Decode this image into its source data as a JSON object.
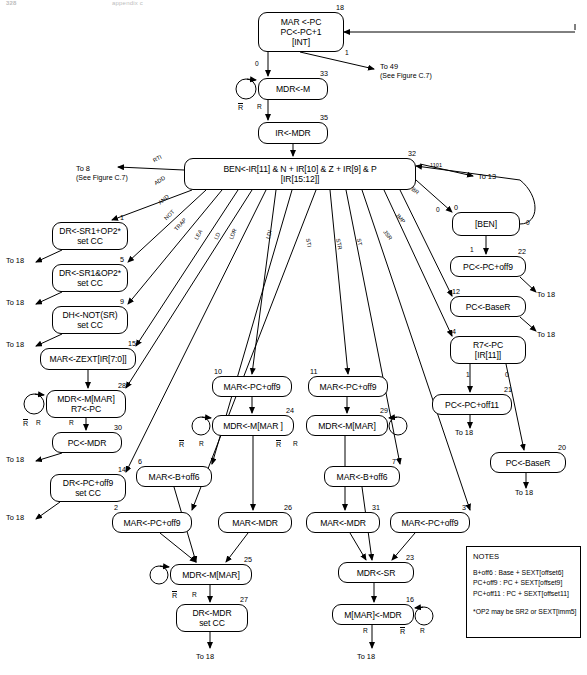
{
  "page": {
    "header_left": "328",
    "header_right": "appendix c"
  },
  "notes": {
    "title": "NOTES",
    "lines": [
      "B+off6 : Base + SEXT[offset6]",
      "PC+off9 : PC + SEXT[offset9]",
      "PC+off11 : PC + SEXT[offset11]"
    ],
    "footnote": "*OP2 may be SR2 or SEXT[imm5]"
  },
  "states": [
    {
      "id": "s18",
      "num": "18",
      "numside": "right",
      "lines": [
        "MAR <-PC",
        "PC<-PC+1",
        "[INT]"
      ],
      "x": 258,
      "y": 12,
      "w": 86,
      "h": 40
    },
    {
      "id": "s33",
      "num": "33",
      "numside": "right",
      "lines": [
        "MDR<-M"
      ],
      "x": 258,
      "y": 78,
      "w": 70,
      "h": 22
    },
    {
      "id": "s35",
      "num": "35",
      "numside": "right",
      "lines": [
        "IR<-MDR"
      ],
      "x": 258,
      "y": 122,
      "w": 70,
      "h": 22
    },
    {
      "id": "s32",
      "num": "32",
      "numside": "right",
      "lines": [
        "BEN<-IR[11] & N + IR[10] & Z + IR[9] & P",
        "[IR[15:12]]"
      ],
      "x": 184,
      "y": 158,
      "w": 232,
      "h": 32
    },
    {
      "id": "s1",
      "num": "1",
      "numside": "right",
      "lines": [
        "DR<-SR1+OP2*",
        "set CC"
      ],
      "x": 52,
      "y": 222,
      "w": 76,
      "h": 28
    },
    {
      "id": "s5",
      "num": "5",
      "numside": "right",
      "lines": [
        "DR<-SR1&OP2*",
        "set CC"
      ],
      "x": 52,
      "y": 264,
      "w": 76,
      "h": 28
    },
    {
      "id": "s9",
      "num": "9",
      "numside": "right",
      "lines": [
        "DH<-NOT(SR)",
        "set CC"
      ],
      "x": 52,
      "y": 306,
      "w": 76,
      "h": 28
    },
    {
      "id": "s15",
      "num": "15",
      "numside": "right",
      "lines": [
        "MAR<-ZEXT[IR[7:0]]"
      ],
      "x": 40,
      "y": 348,
      "w": 96,
      "h": 22
    },
    {
      "id": "s28",
      "num": "28",
      "numside": "right",
      "lines": [
        "MDR<-M[MAR]",
        "R7<-PC"
      ],
      "x": 46,
      "y": 390,
      "w": 80,
      "h": 28
    },
    {
      "id": "s30",
      "num": "30",
      "numside": "right",
      "lines": [
        "PC<-MDR"
      ],
      "x": 52,
      "y": 432,
      "w": 70,
      "h": 21
    },
    {
      "id": "s14",
      "num": "14",
      "numside": "right",
      "lines": [
        "DR<-PC+off9",
        "set CC"
      ],
      "x": 50,
      "y": 474,
      "w": 76,
      "h": 28
    },
    {
      "id": "s10",
      "num": "10",
      "numside": "left",
      "lines": [
        "MAR<-PC+off9"
      ],
      "x": 212,
      "y": 376,
      "w": 80,
      "h": 21
    },
    {
      "id": "s24",
      "num": "24",
      "numside": "right",
      "lines": [
        "MDR<-M[MAR ]"
      ],
      "x": 212,
      "y": 415,
      "w": 82,
      "h": 21
    },
    {
      "id": "s11",
      "num": "11",
      "numside": "left",
      "lines": [
        "MAR<-PC+off9"
      ],
      "x": 308,
      "y": 376,
      "w": 80,
      "h": 21
    },
    {
      "id": "s29",
      "num": "29",
      "numside": "right",
      "lines": [
        "MDR<-M[MAR]"
      ],
      "x": 306,
      "y": 415,
      "w": 82,
      "h": 21
    },
    {
      "id": "s6",
      "num": "6",
      "numside": "left",
      "lines": [
        "MAR<-B+off6"
      ],
      "x": 136,
      "y": 466,
      "w": 76,
      "h": 21
    },
    {
      "id": "s7",
      "num": "7",
      "numside": "right",
      "lines": [
        "MAR<-B+off6"
      ],
      "x": 324,
      "y": 466,
      "w": 76,
      "h": 21
    },
    {
      "id": "s2",
      "num": "2",
      "numside": "left",
      "lines": [
        "MAR<-PC+off9"
      ],
      "x": 112,
      "y": 512,
      "w": 80,
      "h": 21
    },
    {
      "id": "s26",
      "num": "26",
      "numside": "right",
      "lines": [
        "MAR<-MDR"
      ],
      "x": 218,
      "y": 512,
      "w": 74,
      "h": 21
    },
    {
      "id": "s31",
      "num": "31",
      "numside": "right",
      "lines": [
        "MAR<-MDR"
      ],
      "x": 306,
      "y": 512,
      "w": 74,
      "h": 21
    },
    {
      "id": "s3",
      "num": "3",
      "numside": "right",
      "lines": [
        "MAR<-PC+off9"
      ],
      "x": 390,
      "y": 512,
      "w": 80,
      "h": 21
    },
    {
      "id": "s25",
      "num": "25",
      "numside": "right",
      "lines": [
        "MDR<-M[MAR]"
      ],
      "x": 170,
      "y": 564,
      "w": 82,
      "h": 21
    },
    {
      "id": "s27",
      "num": "27",
      "numside": "right",
      "lines": [
        "DR<-MDR",
        "set CC"
      ],
      "x": 176,
      "y": 604,
      "w": 72,
      "h": 28
    },
    {
      "id": "s23",
      "num": "23",
      "numside": "right",
      "lines": [
        "MDR<-SR"
      ],
      "x": 338,
      "y": 562,
      "w": 76,
      "h": 21
    },
    {
      "id": "s16",
      "num": "16",
      "numside": "right",
      "lines": [
        "M[MAR]<-MDR"
      ],
      "x": 332,
      "y": 604,
      "w": 82,
      "h": 21
    },
    {
      "id": "sben",
      "num": "0",
      "numside": "left",
      "lines": [
        "[BEN]"
      ],
      "x": 452,
      "y": 212,
      "w": 68,
      "h": 24
    },
    {
      "id": "s22",
      "num": "22",
      "numside": "right",
      "lines": [
        "PC<-PC+off9"
      ],
      "x": 450,
      "y": 256,
      "w": 76,
      "h": 21
    },
    {
      "id": "s12",
      "num": "12",
      "numside": "left",
      "lines": [
        "PC<-BaseR"
      ],
      "x": 450,
      "y": 296,
      "w": 76,
      "h": 21
    },
    {
      "id": "s4",
      "num": "4",
      "numside": "left",
      "lines": [
        "R7<-PC",
        "[IR[11]]"
      ],
      "x": 450,
      "y": 336,
      "w": 76,
      "h": 28
    },
    {
      "id": "s21",
      "num": "21",
      "numside": "right",
      "lines": [
        "PC<-PC+off11"
      ],
      "x": 432,
      "y": 394,
      "w": 80,
      "h": 21
    },
    {
      "id": "s20",
      "num": "20",
      "numside": "right",
      "lines": [
        "PC<-BaseR"
      ],
      "x": 490,
      "y": 452,
      "w": 76,
      "h": 21
    }
  ],
  "op_labels": [
    {
      "text": "RTI",
      "x": 152,
      "y": 158,
      "rot": -28
    },
    {
      "text": "ADD",
      "x": 153,
      "y": 181,
      "rot": -32
    },
    {
      "text": "AND",
      "x": 157,
      "y": 201,
      "rot": -40
    },
    {
      "text": "NOT",
      "x": 163,
      "y": 217,
      "rot": -46
    },
    {
      "text": "TRAP",
      "x": 173,
      "y": 228,
      "rot": -48
    },
    {
      "text": "LEA",
      "x": 193,
      "y": 238,
      "rot": -62
    },
    {
      "text": "LD",
      "x": 213,
      "y": 238,
      "rot": -66
    },
    {
      "text": "LDR",
      "x": 228,
      "y": 238,
      "rot": -68
    },
    {
      "text": "LDI",
      "x": 265,
      "y": 238,
      "rot": -76
    },
    {
      "text": "STI",
      "x": 311,
      "y": 238,
      "rot": 80
    },
    {
      "text": "STR",
      "x": 341,
      "y": 238,
      "rot": 78
    },
    {
      "text": "ST",
      "x": 362,
      "y": 238,
      "rot": 80
    },
    {
      "text": "JSR",
      "x": 387,
      "y": 229,
      "rot": 52
    },
    {
      "text": "JMP",
      "x": 399,
      "y": 212,
      "rot": 48
    },
    {
      "text": "BR",
      "x": 414,
      "y": 186,
      "rot": 36
    },
    {
      "text": "1101",
      "x": 430,
      "y": 162,
      "rot": 0
    }
  ],
  "edge_labels": [
    {
      "text": "0",
      "x": 255,
      "y": 60
    },
    {
      "text": "1",
      "x": 345,
      "y": 49
    },
    {
      "text": "R",
      "x": 257,
      "y": 103
    },
    {
      "text": "R",
      "x": 36,
      "y": 419
    },
    {
      "text": "R",
      "x": 69,
      "y": 419
    },
    {
      "text": "R",
      "x": 199,
      "y": 440
    },
    {
      "text": "R",
      "x": 192,
      "y": 591
    },
    {
      "text": "R",
      "x": 363,
      "y": 627
    },
    {
      "text": "R",
      "x": 420,
      "y": 627
    },
    {
      "text": "R",
      "x": 293,
      "y": 440
    },
    {
      "text": "0",
      "x": 436,
      "y": 206
    },
    {
      "text": "0",
      "x": 526,
      "y": 219
    },
    {
      "text": "1",
      "x": 470,
      "y": 246
    },
    {
      "text": "1",
      "x": 466,
      "y": 371
    },
    {
      "text": "0",
      "x": 505,
      "y": 371
    }
  ],
  "rbar_labels": [
    {
      "x": 238,
      "y": 103
    },
    {
      "x": 23,
      "y": 419
    },
    {
      "x": 179,
      "y": 440
    },
    {
      "x": 276,
      "y": 440
    },
    {
      "x": 172,
      "y": 591
    },
    {
      "x": 400,
      "y": 627
    }
  ],
  "goto_labels": [
    {
      "text": "To 49",
      "sub": "(See Figure C.7)",
      "x": 380,
      "y": 62
    },
    {
      "text": "To 8",
      "sub": "(See Figure C.7)",
      "x": 76,
      "y": 164
    },
    {
      "text": "To 13",
      "sub": "",
      "x": 478,
      "y": 172
    },
    {
      "text": "To 18",
      "sub": "",
      "x": 6,
      "y": 256
    },
    {
      "text": "To 18",
      "sub": "",
      "x": 6,
      "y": 298
    },
    {
      "text": "To 18",
      "sub": "",
      "x": 6,
      "y": 340
    },
    {
      "text": "To 18",
      "sub": "",
      "x": 6,
      "y": 455
    },
    {
      "text": "To 18",
      "sub": "",
      "x": 6,
      "y": 513
    },
    {
      "text": "To 18",
      "sub": "",
      "x": 537,
      "y": 290
    },
    {
      "text": "To 18",
      "sub": "",
      "x": 537,
      "y": 330
    },
    {
      "text": "To 18",
      "sub": "",
      "x": 455,
      "y": 428
    },
    {
      "text": "To 18",
      "sub": "",
      "x": 515,
      "y": 488
    },
    {
      "text": "To 18",
      "sub": "",
      "x": 196,
      "y": 652
    },
    {
      "text": "To 18",
      "sub": "",
      "x": 357,
      "y": 652
    }
  ]
}
